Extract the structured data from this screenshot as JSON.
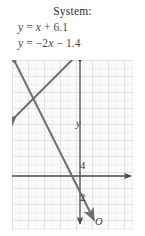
{
  "caption": "System:",
  "equations": [
    {
      "id": "eq1",
      "lhs": "y",
      "rel": " = ",
      "rhs": "x + 6.1",
      "full": "y = x + 6.1"
    },
    {
      "id": "eq2",
      "lhs": "y",
      "rel": " = ",
      "rhs": "−2x − 1.4",
      "full": "y = −2x − 1.4"
    }
  ],
  "graph": {
    "axis_labels": {
      "x": "x",
      "y": "y",
      "origin": "O"
    },
    "x_ticks": [
      "−2",
      "2"
    ],
    "y_ticks": [
      "4",
      "2",
      "−2"
    ],
    "colors": {
      "line": "#6b6b6b",
      "axis": "#4a4a4a",
      "grid_minor": "#e4e4e6",
      "grid_major": "#d2d2d6",
      "background": "#fbfbfb"
    }
  },
  "chart_data": {
    "type": "line",
    "title": "System:",
    "xlabel": "x",
    "ylabel": "y",
    "xlim": [
      -3.5,
      4.0
    ],
    "ylim": [
      -3.0,
      7.5
    ],
    "x_ticks": [
      -2,
      2
    ],
    "y_ticks": [
      4,
      2,
      -2
    ],
    "grid": true,
    "legend": "none",
    "series": [
      {
        "name": "y = x + 6.1",
        "slope": 1,
        "intercept": 6.1,
        "points": [
          [
            -3.4,
            2.7
          ],
          [
            1.2,
            7.3
          ]
        ],
        "arrows": [
          "start",
          "end"
        ]
      },
      {
        "name": "y = -2x - 1.4",
        "slope": -2,
        "intercept": -1.4,
        "points": [
          [
            -3.4,
            5.4
          ],
          [
            1.1,
            -3.6
          ]
        ],
        "arrows": [
          "start",
          "end"
        ]
      }
    ],
    "annotations": [
      "System:",
      "y = x + 6.1",
      "y = −2x − 1.4"
    ]
  }
}
